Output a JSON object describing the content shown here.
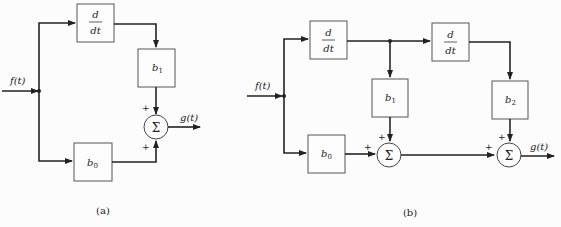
{
  "diagram_a": {
    "caption": "(a)",
    "input_label": "f(t)",
    "output_label": "g(t)",
    "blocks": {
      "diff_num": "d",
      "diff_den": "dt",
      "b1": "b",
      "b1_sub": "1",
      "b0": "b",
      "b0_sub": "0"
    },
    "summer": {
      "symbol": "Σ",
      "sign_top": "+",
      "sign_bottom": "+"
    }
  },
  "diagram_b": {
    "caption": "(b)",
    "input_label": "f(t)",
    "output_label": "g(t)",
    "blocks": {
      "diff1_num": "d",
      "diff1_den": "dt",
      "diff2_num": "d",
      "diff2_den": "dt",
      "b0": "b",
      "b0_sub": "0",
      "b1": "b",
      "b1_sub": "1",
      "b2": "b",
      "b2_sub": "2"
    },
    "summer1": {
      "symbol": "Σ",
      "sign_left": "+",
      "sign_top": "+"
    },
    "summer2": {
      "symbol": "Σ",
      "sign_left": "+",
      "sign_top": "+"
    }
  }
}
